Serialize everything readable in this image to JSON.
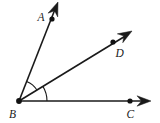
{
  "figure": {
    "type": "geometry-ray-diagram",
    "canvas": {
      "width": 160,
      "height": 123,
      "background": "#ffffff"
    },
    "stroke_color": "#1a1a1a",
    "points": [
      {
        "id": "A",
        "label": "A",
        "dot_x": 52,
        "dot_y": 19,
        "label_x": 37.5,
        "label_y": 20.5
      },
      {
        "id": "D",
        "label": "D",
        "dot_x": 113,
        "dot_y": 42,
        "label_x": 115.5,
        "label_y": 57
      },
      {
        "id": "B",
        "label": "B",
        "dot_x": 19,
        "dot_y": 101,
        "label_x": 9,
        "label_y": 118
      },
      {
        "id": "C",
        "label": "C",
        "dot_x": 130,
        "dot_y": 101,
        "label_x": 126.5,
        "label_y": 118
      }
    ],
    "rays": [
      {
        "id": "BA",
        "label": "ray-ba",
        "from": "B",
        "through": "A",
        "x1": 19,
        "y1": 101,
        "x2": 55.5,
        "y2": 8
      },
      {
        "id": "BD",
        "label": "ray-bd",
        "from": "B",
        "through": "D",
        "x1": 19,
        "y1": 101,
        "x2": 127,
        "y2": 35
      },
      {
        "id": "BC",
        "label": "ray-bc",
        "from": "B",
        "through": "C",
        "x1": 19,
        "y1": 101,
        "x2": 145,
        "y2": 101
      }
    ],
    "arrowheads": [
      {
        "id": "arrow-a",
        "tip_x": 58,
        "tip_y": 2,
        "angle_deg": -68.6
      },
      {
        "id": "arrow-d",
        "tip_x": 132,
        "tip_y": 31,
        "angle_deg": -31.4
      },
      {
        "id": "arrow-c",
        "tip_x": 151,
        "tip_y": 101,
        "angle_deg": 0
      }
    ],
    "angle_arcs": [
      {
        "id": "arc-abd",
        "between": "BA and BD",
        "radius": 21,
        "start_deg": -68.6,
        "end_deg": -31.4
      },
      {
        "id": "arc-dbc",
        "between": "BD and BC",
        "radius": 28,
        "start_deg": -31.4,
        "end_deg": 0
      }
    ]
  }
}
